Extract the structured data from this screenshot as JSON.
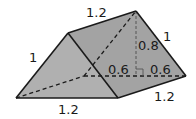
{
  "figure": {
    "type": "triangular-prism",
    "colors": {
      "face_fill": "#a6a6a6",
      "front_face_fill": "#b3b3b3",
      "edge": "#1a1a1a"
    },
    "labels": {
      "top_edge": "1.2",
      "front_slant": "1",
      "back_slant": "1",
      "height": "0.8",
      "half_base_left": "0.6",
      "half_base_right": "0.6",
      "bottom_front": "1.2",
      "bottom_right": "1.2"
    }
  }
}
